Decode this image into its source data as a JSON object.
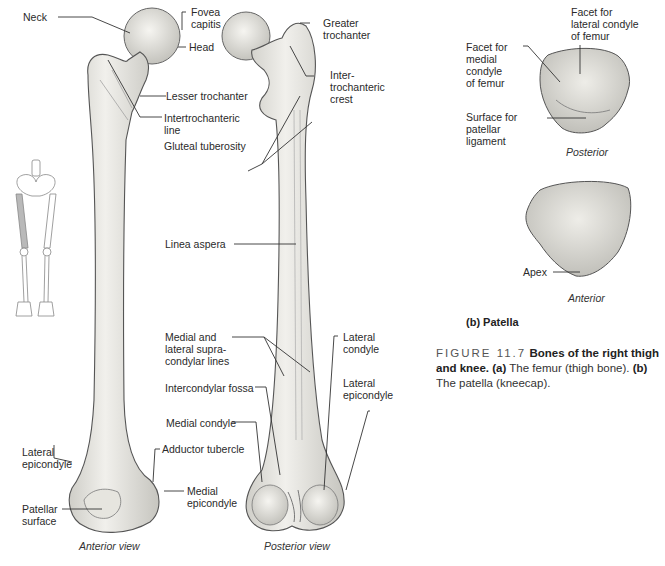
{
  "femur_anterior": {
    "view_label": "Anterior view",
    "labels": {
      "neck": "Neck",
      "fovea_capitis": "Fovea\ncapitis",
      "head": "Head",
      "lesser_trochanter": "Lesser trochanter",
      "intertrochanteric_line": "Intertrochanteric\nline",
      "gluteal_tuberosity": "Gluteal tuberosity",
      "lateral_epicondyle": "Lateral\nepicondyle",
      "patellar_surface": "Patellar\nsurface",
      "adductor_tubercle": "Adductor tubercle",
      "medial_epicondyle": "Medial\nepicondyle"
    }
  },
  "femur_posterior": {
    "view_label": "Posterior view",
    "labels": {
      "greater_trochanter": "Greater\ntrochanter",
      "intertrochanteric_crest": "Inter-\ntrochanteric\ncrest",
      "linea_aspera": "Linea aspera",
      "supracondylar_lines": "Medial and\nlateral supra-\ncondylar lines",
      "intercondylar_fossa": "Intercondylar fossa",
      "medial_condyle": "Medial condyle",
      "lateral_condyle": "Lateral\ncondyle",
      "lateral_epicondyle": "Lateral\nepicondyle"
    }
  },
  "patella": {
    "subtitle": "(b) Patella",
    "posterior": {
      "view_label": "Posterior",
      "labels": {
        "facet_lateral": "Facet for\nlateral condyle\nof femur",
        "facet_medial": "Facet for\nmedial\ncondyle\nof femur",
        "surface_ligament": "Surface for\npatellar\nligament"
      }
    },
    "anterior": {
      "view_label": "Anterior",
      "labels": {
        "apex": "Apex"
      }
    }
  },
  "caption": {
    "figure_number": "FIGURE 11.7",
    "title": "Bones of the right thigh and knee.",
    "part_a_marker": "(a)",
    "part_a_text": "The femur (thigh bone).",
    "part_b_marker": "(b)",
    "part_b_text": "The patella (kneecap)."
  },
  "colors": {
    "bone_fill": "#ecebe6",
    "bone_shade": "#c9c8c2",
    "bone_outline": "#555555",
    "leader": "#333333",
    "highlight_femur": "#b9b9b9"
  }
}
